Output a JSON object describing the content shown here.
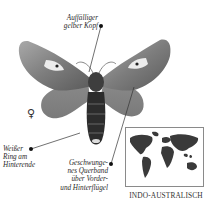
{
  "figure": {
    "sex_symbol": "♀",
    "labels": {
      "head": [
        "Auffälliger",
        "gelber Kopf"
      ],
      "ring": [
        "Weißer",
        "Ring am",
        "Hinterende"
      ],
      "band": [
        "Geschwunge-",
        "nes Querband",
        "über Vorder-",
        "und Hinterflügel"
      ]
    },
    "distribution_map": {
      "caption": "INDO-AUSTRALISCH"
    }
  }
}
